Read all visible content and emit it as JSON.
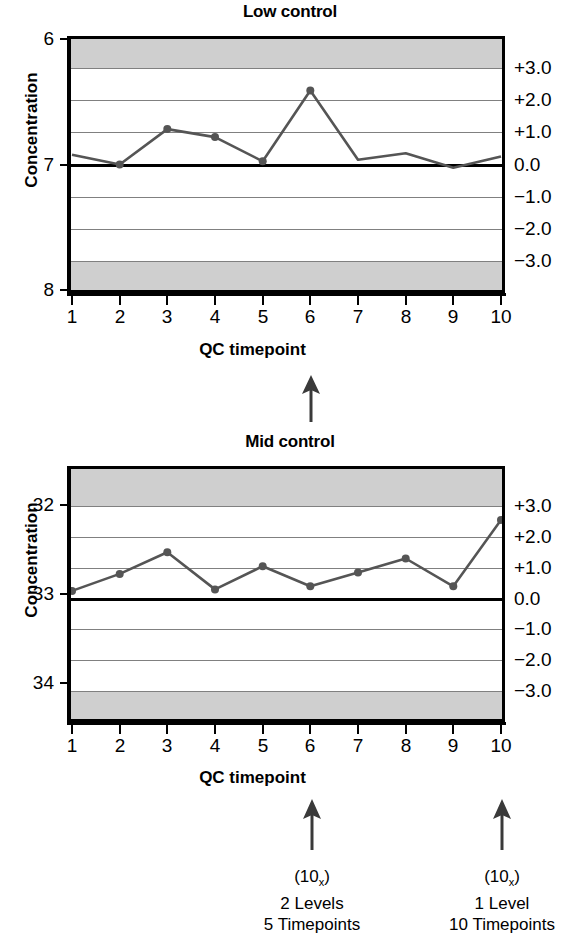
{
  "figure": {
    "background": "#ffffff",
    "series_color": "#555555",
    "band_color": "#cfcfcf",
    "grid_color": "#808080",
    "axis_color": "#000000"
  },
  "charts": [
    {
      "id": "low-control",
      "title": "Low control",
      "xlabel": "QC timepoint",
      "ylabel": "Concentration",
      "y_left_ticks": [
        "8",
        "7",
        "6"
      ],
      "y_left_values": [
        8,
        7,
        6
      ],
      "y_right_ticks": [
        "+3.0",
        "+2.0",
        "+1.0",
        "0.0",
        "−1.0",
        "−2.0",
        "−3.0"
      ],
      "y_right_values": [
        3,
        2,
        1,
        0,
        -1,
        -2,
        -3
      ],
      "x_ticks": [
        "1",
        "2",
        "3",
        "4",
        "5",
        "6",
        "7",
        "8",
        "9",
        "10"
      ]
    },
    {
      "id": "mid-control",
      "title": "Mid control",
      "xlabel": "QC timepoint",
      "ylabel": "Concentration",
      "y_left_ticks": [
        "34",
        "33",
        "32"
      ],
      "y_left_values": [
        34,
        33,
        32
      ],
      "y_right_ticks": [
        "+3.0",
        "+2.0",
        "+1.0",
        "0.0",
        "−1.0",
        "−2.0",
        "−3.0"
      ],
      "y_right_values": [
        3,
        2,
        1,
        0,
        -1,
        -2,
        -3
      ],
      "x_ticks": [
        "1",
        "2",
        "3",
        "4",
        "5",
        "6",
        "7",
        "8",
        "9",
        "10"
      ]
    }
  ],
  "annotations": {
    "mid_arrow": "up-arrow",
    "left_note": {
      "line1_prefix": "(10",
      "line1_sub": "x",
      "line1_suffix": ")",
      "line2": "2 Levels",
      "line3": "5 Timepoints"
    },
    "right_note": {
      "line1_prefix": "(10",
      "line1_sub": "x",
      "line1_suffix": ")",
      "line2": "1 Level",
      "line3": "10 Timepoints"
    }
  },
  "chart_data": [
    {
      "type": "line",
      "id": "low-control",
      "title": "Low control",
      "xlabel": "QC timepoint",
      "ylabel": "Concentration",
      "x": [
        1,
        2,
        3,
        4,
        5,
        6,
        7,
        8,
        9,
        10
      ],
      "values_sd": [
        0.3,
        0.0,
        1.1,
        0.85,
        0.1,
        2.3,
        0.15,
        0.35,
        -0.1,
        0.25
      ],
      "values_concentration": [
        7.1,
        7.0,
        7.27,
        7.21,
        7.03,
        7.62,
        7.05,
        7.12,
        6.97,
        7.08
      ],
      "markers_at": [
        2,
        3,
        4,
        5,
        6
      ],
      "ylim": [
        6,
        8
      ],
      "ylim_sd": [
        -3.9,
        3.9
      ],
      "y_left_ticks": [
        6,
        7,
        8
      ],
      "y_right_ticks": [
        -3,
        -2,
        -1,
        0,
        1,
        2,
        3
      ],
      "y_right_tick_labels": [
        "−3.0",
        "−2.0",
        "−1.0",
        "0.0",
        "+1.0",
        "+2.0",
        "+3.0"
      ],
      "center_line_sd": 0,
      "shaded_bands_sd": [
        [
          3,
          3.9
        ],
        [
          -3.9,
          -3
        ]
      ],
      "grid": true,
      "legend": "none"
    },
    {
      "type": "line",
      "id": "mid-control",
      "title": "Mid control",
      "xlabel": "QC timepoint",
      "ylabel": "Concentration",
      "x": [
        1,
        2,
        3,
        4,
        5,
        6,
        7,
        8,
        9,
        10
      ],
      "values_sd": [
        0.25,
        0.8,
        1.5,
        0.3,
        1.05,
        0.4,
        0.85,
        1.3,
        0.4,
        2.55
      ],
      "values_concentration": [
        33.08,
        33.27,
        33.5,
        33.1,
        33.35,
        33.13,
        33.28,
        33.43,
        33.13,
        33.85
      ],
      "markers_at": [
        1,
        2,
        3,
        4,
        5,
        6,
        7,
        8,
        9,
        10
      ],
      "ylim": [
        31.6,
        34.4
      ],
      "ylim_sd": [
        -3.9,
        4.2
      ],
      "y_left_ticks": [
        32,
        33,
        34
      ],
      "y_right_ticks": [
        -3,
        -2,
        -1,
        0,
        1,
        2,
        3
      ],
      "y_right_tick_labels": [
        "−3.0",
        "−2.0",
        "−1.0",
        "0.0",
        "+1.0",
        "+2.0",
        "+3.0"
      ],
      "center_line_sd": 0,
      "shaded_bands_sd": [
        [
          3,
          4.2
        ],
        [
          -3.9,
          -3
        ]
      ],
      "grid": true,
      "legend": "none"
    }
  ]
}
